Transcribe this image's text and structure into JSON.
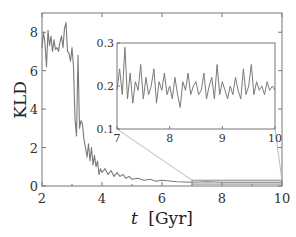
{
  "chart_data": {
    "type": "line",
    "title": "",
    "xlabel_var": "t",
    "xlabel_unit": "[Gyr]",
    "xlabel": "t [Gyr]",
    "ylabel": "KLD",
    "xlim": [
      2,
      10
    ],
    "ylim": [
      0,
      9
    ],
    "xticks": [
      "2",
      "4",
      "6",
      "8",
      "10"
    ],
    "yticks": [
      "0",
      "2",
      "4",
      "6",
      "8"
    ],
    "grid": false,
    "legend": null,
    "line_color": "#7a7a7a",
    "series": [
      {
        "name": "KLD",
        "x": [
          2.0,
          2.05,
          2.1,
          2.15,
          2.2,
          2.25,
          2.3,
          2.35,
          2.4,
          2.45,
          2.5,
          2.55,
          2.6,
          2.65,
          2.7,
          2.75,
          2.8,
          2.85,
          2.9,
          2.95,
          3.0,
          3.05,
          3.1,
          3.15,
          3.2,
          3.25,
          3.3,
          3.35,
          3.4,
          3.45,
          3.5,
          3.55,
          3.6,
          3.65,
          3.7,
          3.75,
          3.8,
          3.85,
          3.9,
          3.95,
          4.0,
          4.1,
          4.2,
          4.3,
          4.4,
          4.5,
          4.6,
          4.7,
          4.8,
          4.9,
          5.0,
          5.2,
          5.4,
          5.6,
          5.8,
          6.0,
          6.5,
          7.0,
          7.5,
          8.0,
          8.5,
          9.0,
          9.5,
          10.0
        ],
        "y": [
          7.2,
          8.0,
          7.4,
          6.2,
          8.1,
          7.3,
          7.8,
          7.0,
          7.6,
          7.1,
          7.2,
          7.0,
          7.5,
          7.8,
          7.2,
          8.2,
          8.5,
          7.0,
          6.9,
          6.5,
          7.2,
          6.2,
          3.5,
          2.6,
          6.8,
          3.0,
          3.4,
          3.2,
          2.4,
          2.0,
          1.5,
          2.2,
          1.3,
          2.0,
          1.1,
          1.6,
          1.0,
          1.3,
          0.6,
          0.9,
          0.7,
          0.9,
          0.6,
          0.8,
          0.5,
          0.7,
          0.5,
          0.6,
          0.4,
          0.5,
          0.35,
          0.4,
          0.3,
          0.35,
          0.25,
          0.3,
          0.22,
          0.2,
          0.22,
          0.19,
          0.2,
          0.19,
          0.2,
          0.19
        ]
      }
    ],
    "zoom_box": {
      "x": [
        7,
        10
      ],
      "y": [
        0.1,
        0.3
      ]
    },
    "inset": {
      "type": "line",
      "xlim": [
        7,
        10
      ],
      "ylim": [
        0.1,
        0.3
      ],
      "xticks": [
        "7",
        "8",
        "9",
        "10"
      ],
      "yticks": [
        "0.1",
        "0.2",
        "0.3"
      ],
      "series": [
        {
          "name": "KLD (zoom)",
          "x": [
            7.0,
            7.05,
            7.1,
            7.15,
            7.2,
            7.25,
            7.3,
            7.35,
            7.4,
            7.45,
            7.5,
            7.55,
            7.6,
            7.65,
            7.7,
            7.75,
            7.8,
            7.85,
            7.9,
            7.95,
            8.0,
            8.05,
            8.1,
            8.15,
            8.2,
            8.25,
            8.3,
            8.35,
            8.4,
            8.45,
            8.5,
            8.55,
            8.6,
            8.65,
            8.7,
            8.75,
            8.8,
            8.85,
            8.9,
            8.95,
            9.0,
            9.05,
            9.1,
            9.15,
            9.2,
            9.25,
            9.3,
            9.35,
            9.4,
            9.45,
            9.5,
            9.55,
            9.6,
            9.65,
            9.7,
            9.75,
            9.8,
            9.85,
            9.9,
            9.95,
            10.0
          ],
          "y": [
            0.19,
            0.24,
            0.18,
            0.29,
            0.17,
            0.23,
            0.16,
            0.21,
            0.19,
            0.25,
            0.17,
            0.22,
            0.18,
            0.2,
            0.24,
            0.16,
            0.21,
            0.19,
            0.23,
            0.18,
            0.2,
            0.17,
            0.22,
            0.18,
            0.15,
            0.21,
            0.19,
            0.23,
            0.18,
            0.2,
            0.21,
            0.18,
            0.19,
            0.23,
            0.17,
            0.2,
            0.22,
            0.17,
            0.25,
            0.18,
            0.21,
            0.19,
            0.17,
            0.2,
            0.18,
            0.22,
            0.19,
            0.17,
            0.24,
            0.18,
            0.2,
            0.25,
            0.18,
            0.21,
            0.19,
            0.2,
            0.18,
            0.21,
            0.19,
            0.2,
            0.19
          ]
        }
      ]
    }
  }
}
